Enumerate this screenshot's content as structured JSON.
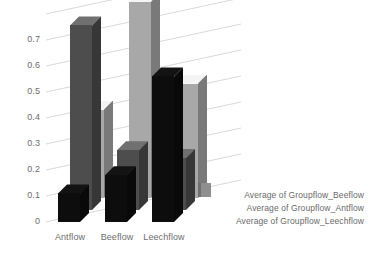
{
  "chart_data": {
    "type": "bar",
    "title": "",
    "subtitle": "",
    "xlabel": "",
    "ylabel": "",
    "categories": [
      "Antflow",
      "Beeflow",
      "Leechflow"
    ],
    "series": [
      {
        "name": "Average of Groupflow_Leechflow",
        "color": "#0d0d0d",
        "values": [
          0.11,
          0.18,
          0.56
        ]
      },
      {
        "name": "Average of Groupflow_Antflow",
        "color": "#4d4d4d",
        "values": [
          0.71,
          0.23,
          0.2
        ]
      },
      {
        "name": "Average of Groupflow_Beeflow",
        "color": "#a8a8a8",
        "values": [
          0.34,
          0.755,
          0.44
        ]
      }
    ],
    "ylim": [
      0,
      0.8
    ],
    "yticks": [
      "0",
      "0.1",
      "0.2",
      "0.3",
      "0.4",
      "0.5",
      "0.6",
      "0.7"
    ],
    "ytick_values": [
      0,
      0.1,
      0.2,
      0.3,
      0.4,
      0.5,
      0.6,
      0.7
    ],
    "grid": true,
    "grid_color": "#d9d9d9",
    "legend_position": "right",
    "legend_entries": [
      "Average of Groupflow_Beeflow",
      "Average of Groupflow_Antflow",
      "Average of Groupflow_Leechflow"
    ],
    "three_d": true,
    "background": "#ffffff",
    "text_color": "#6d6d6d"
  },
  "axis": {
    "ytick_0": "0",
    "ytick_1": "0.1",
    "ytick_2": "0.2",
    "ytick_3": "0.3",
    "ytick_4": "0.4",
    "ytick_5": "0.5",
    "ytick_6": "0.6",
    "ytick_7": "0.7",
    "xtick_0": "Antflow",
    "xtick_1": "Beeflow",
    "xtick_2": "Leechflow"
  },
  "legend": {
    "entry_0": "Average of Groupflow_Beeflow",
    "entry_1": "Average of Groupflow_Antflow",
    "entry_2": "Average of Groupflow_Leechflow"
  }
}
